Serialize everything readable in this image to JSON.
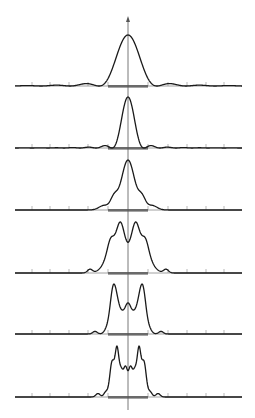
{
  "figure": {
    "colors": {
      "curve": "#1a1a1a",
      "axis": "#555555",
      "tick": "#888888",
      "aperture_bar": "#6a6a6a",
      "background": "#ffffff"
    },
    "axis": {
      "center_x": 128,
      "top_arrow_y": 16,
      "bottom_y": 410,
      "x_left": 15,
      "x_right": 242,
      "tick_xs": [
        32,
        50,
        69,
        88,
        108,
        148,
        168,
        187,
        206,
        224
      ]
    },
    "aperture": {
      "x_start": 108,
      "x_end": 148
    },
    "panels": [
      {
        "id": 1,
        "baseline_y": 86,
        "type": "sinc2",
        "width": 24,
        "height": 51,
        "note": "Fraunhofer pattern"
      },
      {
        "id": 2,
        "baseline_y": 148,
        "type": "sinc2",
        "width": 13,
        "height": 51,
        "note": "narrower central peak"
      },
      {
        "id": 3,
        "baseline_y": 210,
        "type": "shoulders",
        "height": 50,
        "note": "central peak with shoulders"
      },
      {
        "id": 4,
        "baseline_y": 273,
        "type": "double",
        "height": 51,
        "note": "two peaks, center dip"
      },
      {
        "id": 5,
        "baseline_y": 334,
        "type": "triple",
        "height": 50,
        "note": "three peaks"
      },
      {
        "id": 6,
        "baseline_y": 397,
        "type": "multi",
        "height": 51,
        "note": "many fringes, Fresnel regime"
      }
    ]
  }
}
